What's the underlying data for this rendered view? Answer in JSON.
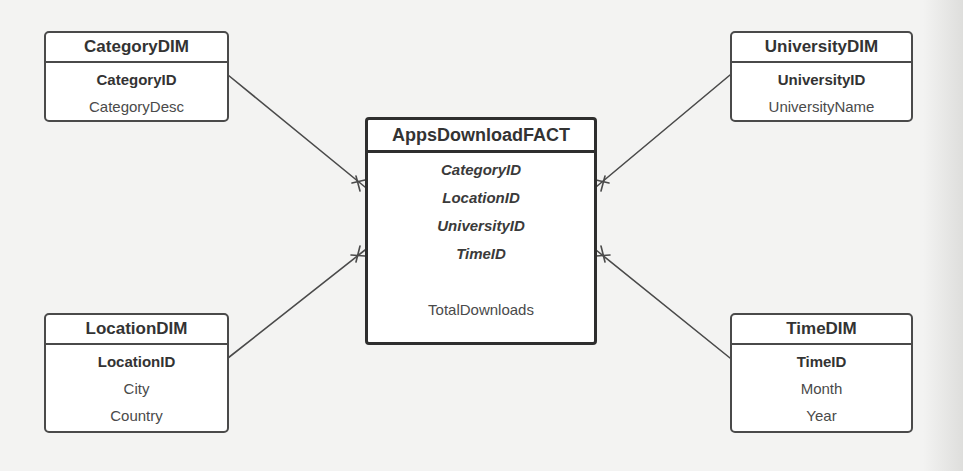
{
  "diagram": {
    "type": "star-schema",
    "fact": {
      "name": "AppsDownloadFACT",
      "foreign_keys": [
        "CategoryID",
        "LocationID",
        "UniversityID",
        "TimeID"
      ],
      "measures": [
        "TotalDownloads"
      ]
    },
    "dimensions": {
      "category": {
        "name": "CategoryDIM",
        "primary_key": "CategoryID",
        "attributes": [
          "CategoryDesc"
        ]
      },
      "university": {
        "name": "UniversityDIM",
        "primary_key": "UniversityID",
        "attributes": [
          "UniversityName"
        ]
      },
      "location": {
        "name": "LocationDIM",
        "primary_key": "LocationID",
        "attributes": [
          "City",
          "Country"
        ]
      },
      "time": {
        "name": "TimeDIM",
        "primary_key": "TimeID",
        "attributes": [
          "Month",
          "Year"
        ]
      }
    },
    "relationships": [
      {
        "from": "CategoryDIM",
        "to": "AppsDownloadFACT",
        "cardinality": "one-to-many"
      },
      {
        "from": "UniversityDIM",
        "to": "AppsDownloadFACT",
        "cardinality": "one-to-many"
      },
      {
        "from": "LocationDIM",
        "to": "AppsDownloadFACT",
        "cardinality": "one-to-many"
      },
      {
        "from": "TimeDIM",
        "to": "AppsDownloadFACT",
        "cardinality": "one-to-many"
      }
    ],
    "colors": {
      "background": "#f3f3f2",
      "box_fill": "#ffffff",
      "border": "#4a4a4a",
      "fact_border": "#2e2e2e",
      "line": "#4a4a4a"
    }
  }
}
